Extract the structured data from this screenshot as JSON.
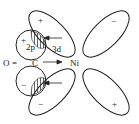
{
  "diagram": {
    "labels": {
      "oxygen": "O",
      "bond": "=",
      "carbon": "C",
      "nickel": "Ni",
      "orbital_2p": "2p",
      "orbital_3d": "3d"
    },
    "signs": {
      "p_upper": "+",
      "p_lower": "−",
      "d_upper_left": "+",
      "d_upper_right": "−",
      "d_lower_left": "−",
      "d_lower_right": "+"
    },
    "colors": {
      "line": "#222222",
      "background": "#ffffff"
    }
  }
}
